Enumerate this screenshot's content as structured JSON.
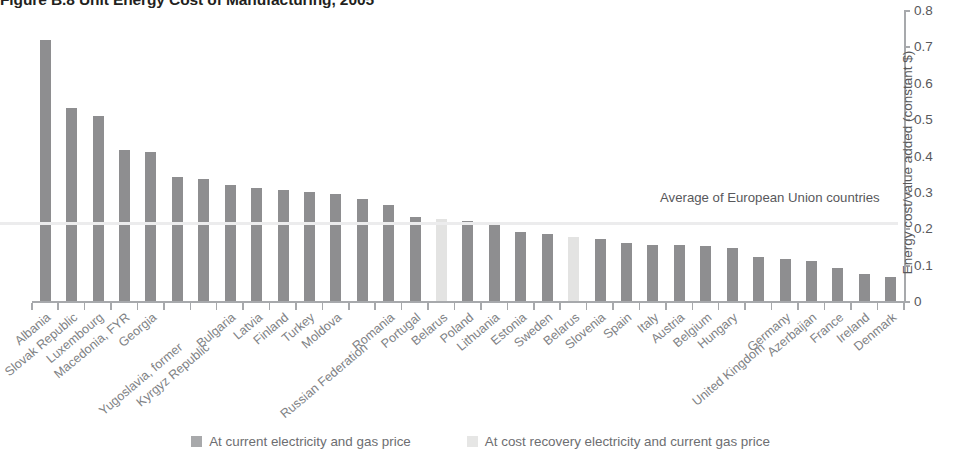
{
  "figure": {
    "title": "Figure B.8  Unit Energy Cost of Manufacturing, 2005"
  },
  "annotation": {
    "average_line_label": "Average of European Union countries"
  },
  "legend": {
    "position": "bottom-center",
    "items": [
      {
        "label": "At current electricity and gas price",
        "swatch": "dark",
        "color": "#8e8e90"
      },
      {
        "label": "At cost recovery electricity and current gas price",
        "swatch": "lite",
        "color": "#e3e3e2"
      }
    ]
  },
  "yaxis": {
    "title": "Energy cost/value added (constant $)",
    "ticks": [
      "0.8",
      "0.7",
      "0.6",
      "0.5",
      "0.4",
      "0.3",
      "0.2",
      "0.1",
      "0"
    ]
  },
  "chart_data": {
    "type": "bar",
    "title": "Figure B.8  Unit Energy Cost of Manufacturing, 2005",
    "xlabel": "",
    "ylabel": "Energy cost/value added (constant $)",
    "ylim": [
      0,
      0.8
    ],
    "ytick_step": 0.1,
    "grid": false,
    "legend_position": "bottom-center",
    "annotations": [
      {
        "text": "Average of European Union countries",
        "type": "hline",
        "value": 0.215
      }
    ],
    "categories": [
      "Albania",
      "Slovak Republic",
      "Luxembourg",
      "Macedonia, FYR",
      "Georgia",
      "Yugoslavia, former",
      "Kyrgyz Republic",
      "Bulgaria",
      "Latvia",
      "Finland",
      "Turkey",
      "Moldova",
      "Russian Federation",
      "Romania",
      "Portugal",
      "Belarus",
      "Poland",
      "Lithuania",
      "Estonia",
      "Sweden",
      "Belarus",
      "Slovenia",
      "Spain",
      "Italy",
      "Austria",
      "Belgium",
      "Hungary",
      "United Kingdom",
      "Germany",
      "Azerbaijan",
      "France",
      "Ireland",
      "Denmark"
    ],
    "values": [
      0.717,
      0.53,
      0.51,
      0.415,
      0.41,
      0.34,
      0.335,
      0.32,
      0.31,
      0.305,
      0.3,
      0.295,
      0.28,
      0.265,
      0.23,
      0.225,
      0.22,
      0.215,
      0.19,
      0.185,
      0.175,
      0.17,
      0.16,
      0.155,
      0.155,
      0.15,
      0.145,
      0.12,
      0.115,
      0.11,
      0.09,
      0.075,
      0.065
    ],
    "series_of_point": [
      "current",
      "current",
      "current",
      "current",
      "current",
      "current",
      "current",
      "current",
      "current",
      "current",
      "current",
      "current",
      "current",
      "current",
      "current",
      "cost_recovery",
      "current",
      "current",
      "current",
      "current",
      "cost_recovery",
      "current",
      "current",
      "current",
      "current",
      "current",
      "current",
      "current",
      "current",
      "current",
      "current",
      "current",
      "current"
    ]
  }
}
